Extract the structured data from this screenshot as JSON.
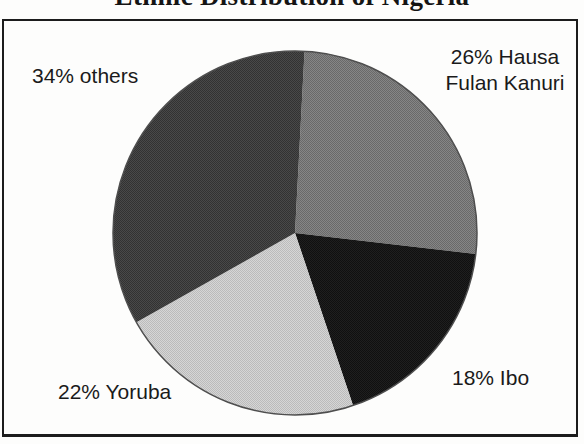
{
  "figure": {
    "title": "Ethnic Distribution of Nigeria"
  },
  "chart_data": {
    "type": "pie",
    "title": "Ethnic Distribution of Nigeria",
    "direction": "clockwise",
    "start_angle_deg": 3,
    "center": {
      "x": 295,
      "y": 233
    },
    "radius": 182,
    "outline_color": "#4e4e4e",
    "label_color": "#1a1a1a",
    "labels_on_chart": true,
    "legend_position": "none",
    "slices": [
      {
        "name": "Hausa Fulan Kanuri",
        "value_pct": 26,
        "label": "26% Hausa\nFulan Kanuri",
        "color": "#696969",
        "color_alt": "#868686"
      },
      {
        "name": "Ibo",
        "value_pct": 18,
        "label": "18% Ibo",
        "color": "#101010",
        "color_alt": "#1f1f1f"
      },
      {
        "name": "Yoruba",
        "value_pct": 22,
        "label": "22% Yoruba",
        "color": "#bbbbbb",
        "color_alt": "#d6d6d6"
      },
      {
        "name": "others",
        "value_pct": 34,
        "label": "34% others",
        "color": "#323232",
        "color_alt": "#494949"
      }
    ]
  }
}
